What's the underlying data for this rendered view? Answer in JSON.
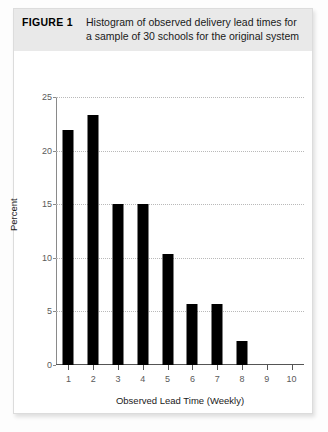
{
  "figure": {
    "label": "FIGURE 1",
    "caption": "Histogram of observed delivery lead times for a sample of 30 schools for the original system"
  },
  "chart_data": {
    "type": "bar",
    "title": "Histogram of observed delivery lead times for a sample of 30 schools for the original system",
    "xlabel": "Observed Lead Time (Weekly)",
    "ylabel": "Percent",
    "categories": [
      "1",
      "2",
      "3",
      "4",
      "5",
      "6",
      "7",
      "8"
    ],
    "values": [
      21.9,
      23.3,
      15.0,
      15.0,
      10.4,
      5.7,
      5.7,
      2.2
    ],
    "xlim": [
      0.5,
      10.5
    ],
    "ylim": [
      0,
      25
    ],
    "xticks": [
      "1",
      "2",
      "3",
      "4",
      "5",
      "6",
      "7",
      "8",
      "9",
      "10"
    ],
    "yticks": [
      "0",
      "5",
      "10",
      "15",
      "20",
      "25"
    ],
    "grid": "horizontal-dotted",
    "legend": "none",
    "bar_color": "#000000",
    "grid_color": "#b9b9b9",
    "axis_color": "#555555"
  }
}
